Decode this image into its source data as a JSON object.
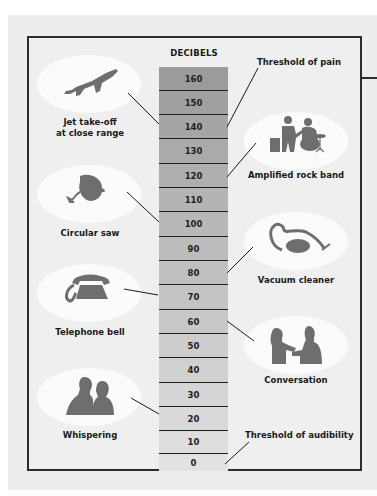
{
  "diagram": {
    "title": "DECIBELS",
    "scale": [
      "160",
      "150",
      "140",
      "130",
      "120",
      "110",
      "100",
      "90",
      "80",
      "70",
      "60",
      "50",
      "40",
      "30",
      "20",
      "10",
      "0"
    ],
    "colors": {
      "column_top": "#9b9b9b",
      "column_bottom": "#e2e2e2",
      "oval": "#fbfbfb",
      "icon": "#6e6e6e",
      "border": "#2b2b2b"
    },
    "left_items": [
      {
        "label_line1": "Jet take-off",
        "label_line2": "at close range",
        "icon": "jet-icon",
        "points_to": "140"
      },
      {
        "label_line1": "Circular saw",
        "icon": "circular-saw-icon",
        "points_to": "100"
      },
      {
        "label_line1": "Telephone bell",
        "icon": "telephone-icon",
        "points_to": "70"
      },
      {
        "label_line1": "Whispering",
        "icon": "whispering-people-icon",
        "points_to": "20"
      }
    ],
    "right_items": [
      {
        "label": "Amplified rock band",
        "icon": "rock-band-icon",
        "points_to": "120"
      },
      {
        "label": "Vacuum cleaner",
        "icon": "vacuum-cleaner-icon",
        "points_to": "80"
      },
      {
        "label": "Conversation",
        "icon": "conversation-icon",
        "points_to": "60"
      }
    ],
    "thresholds": {
      "pain": {
        "label": "Threshold of pain",
        "points_to": "140"
      },
      "audibility": {
        "label": "Threshold of audibility",
        "points_to": "0"
      }
    }
  }
}
